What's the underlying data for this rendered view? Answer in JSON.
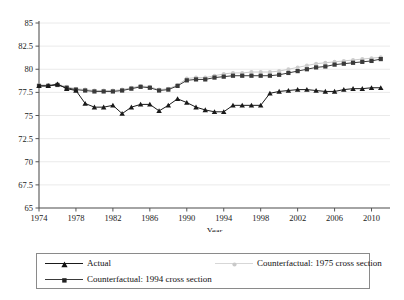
{
  "chart_data": {
    "type": "line",
    "title": "",
    "xlabel": "Year",
    "ylabel": "",
    "xlim": [
      1974,
      2012
    ],
    "ylim": [
      65,
      85
    ],
    "grid": true,
    "legend_position": "bottom",
    "xticks": [
      1974,
      1978,
      1982,
      1986,
      1990,
      1994,
      1998,
      2002,
      2006,
      2010
    ],
    "yticks": [
      65,
      67.5,
      70,
      72.5,
      75,
      77.5,
      80,
      82.5,
      85
    ],
    "x": [
      1974,
      1975,
      1976,
      1977,
      1978,
      1979,
      1980,
      1981,
      1982,
      1983,
      1984,
      1985,
      1986,
      1987,
      1988,
      1989,
      1990,
      1991,
      1992,
      1993,
      1994,
      1995,
      1996,
      1997,
      1998,
      1999,
      2000,
      2001,
      2002,
      2003,
      2004,
      2005,
      2006,
      2007,
      2008,
      2009,
      2010,
      2011
    ],
    "series": [
      {
        "name": "Actual",
        "marker": "triangle",
        "color": "#1a1a1a",
        "values": [
          78.2,
          78.2,
          78.4,
          77.9,
          77.7,
          76.3,
          75.9,
          75.9,
          76.1,
          75.2,
          75.9,
          76.2,
          76.2,
          75.5,
          76.1,
          76.8,
          76.4,
          75.9,
          75.6,
          75.4,
          75.4,
          76.1,
          76.1,
          76.1,
          76.1,
          77.4,
          77.6,
          77.7,
          77.8,
          77.8,
          77.7,
          77.6,
          77.6,
          77.8,
          77.9,
          77.9,
          78.0,
          78.0
        ]
      },
      {
        "name": "Counterfactual: 1975 cross section",
        "marker": "circle",
        "color": "#cccccc",
        "values": [
          78.3,
          78.3,
          78.4,
          78.1,
          77.9,
          77.8,
          77.7,
          77.7,
          77.7,
          77.8,
          78.0,
          78.2,
          78.1,
          77.8,
          77.9,
          78.3,
          79.0,
          79.1,
          79.1,
          79.3,
          79.5,
          79.6,
          79.6,
          79.7,
          79.7,
          79.7,
          79.8,
          80.0,
          80.2,
          80.4,
          80.6,
          80.7,
          80.8,
          80.9,
          81.0,
          81.1,
          81.2,
          81.3
        ]
      },
      {
        "name": "Counterfactual: 1994 cross section",
        "marker": "square",
        "color": "#3a3a3a",
        "values": [
          78.2,
          78.2,
          78.3,
          78.0,
          77.8,
          77.7,
          77.6,
          77.6,
          77.6,
          77.7,
          77.9,
          78.1,
          78.0,
          77.7,
          77.8,
          78.2,
          78.8,
          78.9,
          78.9,
          79.1,
          79.2,
          79.3,
          79.3,
          79.3,
          79.3,
          79.3,
          79.4,
          79.6,
          79.8,
          80.0,
          80.2,
          80.3,
          80.5,
          80.6,
          80.7,
          80.8,
          80.9,
          81.1
        ]
      }
    ]
  },
  "legend": {
    "items": [
      {
        "label": "Actual"
      },
      {
        "label": "Counterfactual: 1975 cross section"
      },
      {
        "label": "Counterfactual: 1994 cross section"
      }
    ]
  }
}
